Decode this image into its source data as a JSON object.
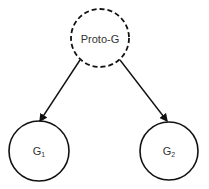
{
  "diagram": {
    "nodes": [
      {
        "id": "proto-g",
        "label": "Proto-G",
        "sub": "",
        "style": "dashed",
        "cx": 100,
        "cy": 38,
        "r": 29
      },
      {
        "id": "g1",
        "label": "G",
        "sub": "1",
        "style": "solid",
        "cx": 39,
        "cy": 151,
        "r": 30
      },
      {
        "id": "g2",
        "label": "G",
        "sub": "2",
        "style": "solid",
        "cx": 169,
        "cy": 151,
        "r": 29
      }
    ],
    "edges": [
      {
        "from": "proto-g",
        "to": "g1",
        "x1": 80,
        "y1": 60,
        "x2": 40,
        "y2": 121
      },
      {
        "from": "proto-g",
        "to": "g2",
        "x1": 120,
        "y1": 60,
        "x2": 167,
        "y2": 121
      }
    ],
    "colors": {
      "stroke": "#111111",
      "text": "#333333"
    }
  }
}
